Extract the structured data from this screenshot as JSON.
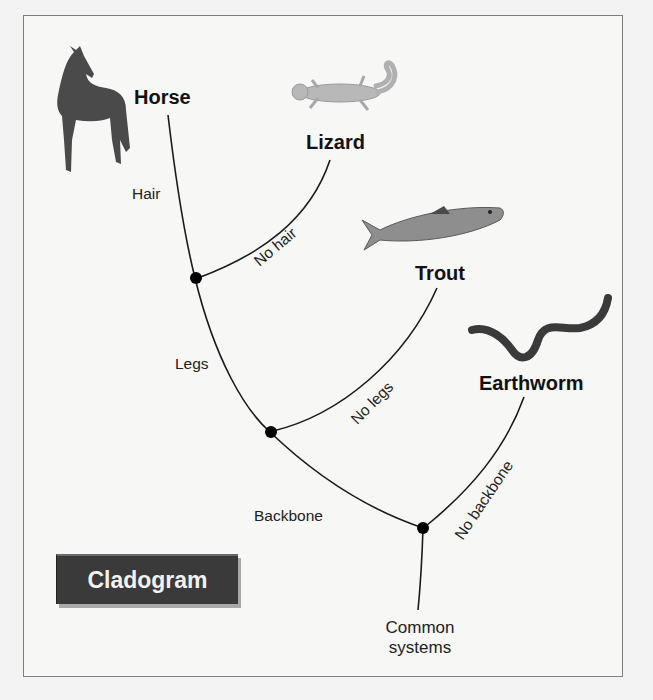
{
  "figure": {
    "title": "Cladogram",
    "colors": {
      "background": "#f7f7f6",
      "line": "#1a1a1a",
      "node": "#000000",
      "badge_bg": "#3a3a3a",
      "badge_text": "#f2f2f2"
    }
  },
  "taxa": [
    {
      "name": "Horse",
      "image": "horse-photo"
    },
    {
      "name": "Lizard",
      "image": "gecko-photo"
    },
    {
      "name": "Trout",
      "image": "trout-photo"
    },
    {
      "name": "Earthworm",
      "image": "earthworm-photo"
    }
  ],
  "traits": {
    "hair": "Hair",
    "no_hair": "No hair",
    "legs": "Legs",
    "no_legs": "No legs",
    "backbone": "Backbone",
    "no_backbone": "No backbone"
  },
  "root": {
    "line1": "Common",
    "line2": "systems"
  },
  "nodes": [
    {
      "id": "hair-node",
      "splits": [
        "Horse",
        "Lizard"
      ]
    },
    {
      "id": "legs-node",
      "splits": [
        "Horse+Lizard",
        "Trout"
      ]
    },
    {
      "id": "backbone-node",
      "splits": [
        "Horse+Lizard+Trout",
        "Earthworm"
      ]
    }
  ]
}
